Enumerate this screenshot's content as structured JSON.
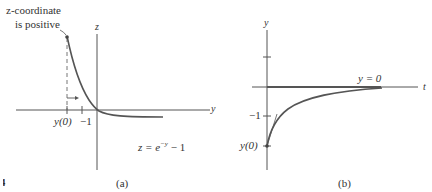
{
  "panels": {
    "a": {
      "caption": "(a)",
      "annotation_line1": "z-coordinate",
      "annotation_line2": "is positive",
      "horizontal_axis_label": "y",
      "vertical_axis_label": "z",
      "tick_labels": {
        "y0": "y(0)",
        "minus_one": "−1"
      },
      "equation": "z = e^{−y} − 1",
      "equation_parts": {
        "lhs": "z = e",
        "exp": "−y",
        "rhs": " − 1"
      }
    },
    "b": {
      "caption": "(b)",
      "horizontal_axis_label": "t",
      "vertical_axis_label": "y",
      "equilibrium_label": "y = 0",
      "tick_labels": {
        "minus_one": "−1",
        "y0": "y(0)"
      }
    },
    "figure_fragment": "4"
  },
  "colors": {
    "axis": "#444444",
    "curve": "#555555",
    "text": "#333333",
    "background": "#ffffff"
  }
}
